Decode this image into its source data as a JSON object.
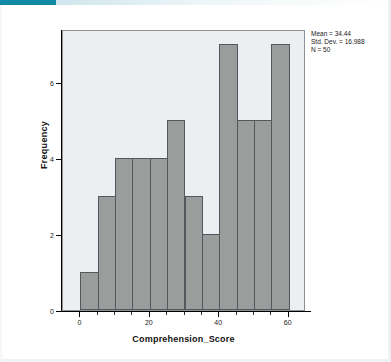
{
  "accent": {
    "color": "#1289a7",
    "name": "accent-strip"
  },
  "chart_data": {
    "type": "bar",
    "title": "",
    "subtitle": "",
    "xlabel": "Comprehension_Score",
    "ylabel": "Frequency",
    "xlim": [
      -5,
      65
    ],
    "ylim": [
      0,
      7.4
    ],
    "grid": false,
    "legend": null,
    "bin_width": 5,
    "bin_starts": [
      0,
      5,
      10,
      15,
      20,
      25,
      30,
      35,
      40,
      45,
      50,
      55
    ],
    "bin_ends": [
      5,
      10,
      15,
      20,
      25,
      30,
      35,
      40,
      45,
      50,
      55,
      60
    ],
    "bin_labels": [
      "0-5",
      "5-10",
      "10-15",
      "15-20",
      "20-25",
      "25-30",
      "30-35",
      "35-40",
      "40-45",
      "45-50",
      "50-55",
      "55-60"
    ],
    "categories": [
      "0-5",
      "5-10",
      "10-15",
      "15-20",
      "20-25",
      "25-30",
      "30-35",
      "35-40",
      "40-45",
      "45-50",
      "50-55",
      "55-60"
    ],
    "values": [
      1,
      3,
      4,
      4,
      4,
      5,
      3,
      2,
      7,
      5,
      5,
      7
    ],
    "total_count": 50,
    "xticks": [
      0,
      20,
      40,
      60
    ],
    "xtick_labels": [
      "0",
      "20",
      "40",
      "60"
    ],
    "yticks": [
      0,
      2,
      4,
      6
    ],
    "ytick_labels": [
      "0",
      "2",
      "4",
      "6"
    ],
    "bar_color": "#9b9c9c",
    "bar_edge_color": "#53565a",
    "plot_background": "#eceff1",
    "annotations": [
      "Mean = 34.44",
      "Std. Dev. = 16.988",
      "N = 50"
    ]
  },
  "stats": {
    "mean_line": "Mean = 34.44",
    "stddev_line": "Std. Dev. = 16.988",
    "n_line": "N = 50"
  }
}
